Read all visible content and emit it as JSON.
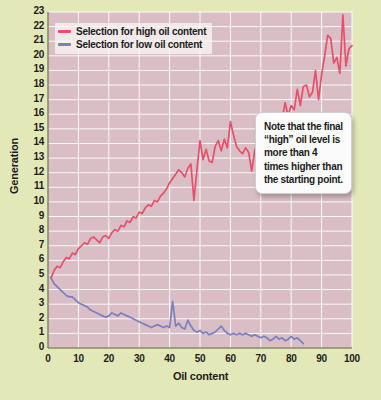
{
  "chart_data": {
    "type": "line",
    "title": "",
    "xlabel": "Oil content",
    "ylabel": "Generation",
    "xlim": [
      0,
      100
    ],
    "ylim": [
      0,
      23
    ],
    "xticks": [
      0,
      10,
      20,
      30,
      40,
      50,
      60,
      70,
      80,
      90,
      100
    ],
    "yticks": [
      0,
      1,
      2,
      3,
      4,
      5,
      6,
      7,
      8,
      9,
      10,
      11,
      12,
      13,
      14,
      15,
      16,
      17,
      18,
      19,
      20,
      21,
      22,
      23
    ],
    "grid": true,
    "legend_position": "top-left",
    "plot_background": "#d9bec6",
    "page_background": "#e3e8b8",
    "gridline_color": "#ffffff",
    "series": [
      {
        "name": "Selection for high oil content",
        "color": "#e8506a",
        "x": [
          1,
          2,
          3,
          4,
          5,
          6,
          7,
          8,
          9,
          10,
          11,
          12,
          13,
          14,
          15,
          16,
          17,
          18,
          19,
          20,
          21,
          22,
          23,
          24,
          25,
          26,
          27,
          28,
          29,
          30,
          31,
          32,
          33,
          34,
          35,
          36,
          37,
          38,
          39,
          40,
          41,
          42,
          43,
          44,
          45,
          46,
          47,
          48,
          49,
          50,
          51,
          52,
          53,
          54,
          55,
          56,
          57,
          58,
          59,
          60,
          61,
          62,
          63,
          64,
          65,
          66,
          67,
          68,
          69,
          70,
          71,
          72,
          73,
          74,
          75,
          76,
          77,
          78,
          79,
          80,
          81,
          82,
          83,
          84,
          85,
          86,
          87,
          88,
          89,
          90,
          91,
          92,
          93,
          94,
          95,
          96,
          97,
          98,
          99,
          100
        ],
        "values": [
          4.8,
          5.3,
          5.6,
          5.5,
          5.9,
          6.2,
          6.1,
          6.5,
          6.4,
          6.8,
          7.0,
          7.2,
          7.1,
          7.5,
          7.6,
          7.4,
          7.2,
          7.6,
          7.7,
          7.5,
          7.9,
          8.1,
          8.0,
          8.4,
          8.3,
          8.7,
          8.6,
          9.0,
          8.9,
          9.3,
          9.2,
          9.6,
          9.8,
          9.7,
          10.1,
          10.0,
          10.4,
          10.6,
          10.9,
          11.3,
          11.6,
          11.9,
          12.2,
          12.0,
          11.7,
          12.3,
          12.6,
          10.1,
          12.2,
          14.2,
          12.9,
          13.6,
          12.8,
          12.7,
          13.8,
          14.2,
          13.5,
          14.3,
          13.7,
          15.5,
          14.6,
          13.8,
          13.5,
          13.3,
          13.7,
          13.4,
          12.1,
          13.5,
          14.2,
          14.6,
          14.4,
          14.7,
          14.9,
          15.1,
          15.0,
          15.4,
          15.6,
          16.8,
          15.9,
          16.6,
          16.3,
          17.7,
          16.6,
          17.9,
          18.0,
          17.2,
          17.5,
          19.0,
          17.0,
          18.7,
          20.0,
          21.4,
          21.2,
          19.5,
          19.9,
          18.8,
          22.8,
          19.3,
          20.5,
          20.7
        ]
      },
      {
        "name": "Selection for low oil content",
        "color": "#7b7fc0",
        "x": [
          1,
          2,
          3,
          4,
          5,
          6,
          7,
          8,
          9,
          10,
          11,
          12,
          13,
          14,
          15,
          16,
          17,
          18,
          19,
          20,
          21,
          22,
          23,
          24,
          25,
          26,
          27,
          28,
          29,
          30,
          31,
          32,
          33,
          34,
          35,
          36,
          37,
          38,
          39,
          40,
          41,
          42,
          43,
          44,
          45,
          46,
          47,
          48,
          49,
          50,
          51,
          52,
          53,
          54,
          55,
          56,
          57,
          58,
          59,
          60,
          61,
          62,
          63,
          64,
          65,
          66,
          67,
          68,
          69,
          70,
          71,
          72,
          73,
          74,
          75,
          76,
          77,
          78,
          79,
          80,
          81,
          82,
          83,
          84
        ],
        "values": [
          4.8,
          4.4,
          4.2,
          4.0,
          3.8,
          3.6,
          3.5,
          3.5,
          3.3,
          3.1,
          3.0,
          2.9,
          2.8,
          2.6,
          2.5,
          2.4,
          2.3,
          2.2,
          2.1,
          2.2,
          2.4,
          2.3,
          2.2,
          2.4,
          2.3,
          2.2,
          2.1,
          2.0,
          1.9,
          1.8,
          1.7,
          1.6,
          1.5,
          1.4,
          1.5,
          1.6,
          1.5,
          1.4,
          1.5,
          1.4,
          3.2,
          1.5,
          1.7,
          1.4,
          1.3,
          1.9,
          1.5,
          1.2,
          1.1,
          1.2,
          1.0,
          1.1,
          0.9,
          1.0,
          1.1,
          1.3,
          1.5,
          1.2,
          1.0,
          0.9,
          1.0,
          0.9,
          1.0,
          0.9,
          1.0,
          0.9,
          0.8,
          0.9,
          0.8,
          0.7,
          0.8,
          0.7,
          0.5,
          0.6,
          0.8,
          0.6,
          0.7,
          0.5,
          0.6,
          0.8,
          0.6,
          0.7,
          0.5,
          0.3
        ]
      }
    ],
    "annotations": [
      {
        "text": "Note that the final “high” oil level is more than 4 times higher than the starting point."
      }
    ]
  },
  "legend": {
    "items": [
      {
        "label": "Selection for high oil content",
        "color": "#e8506a"
      },
      {
        "label": "Selection for low oil content",
        "color": "#7b7fc0"
      }
    ]
  }
}
